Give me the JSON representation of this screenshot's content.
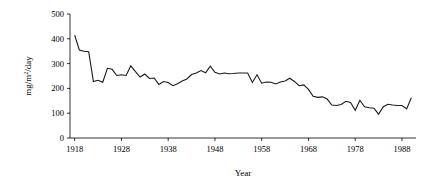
{
  "chart_data": {
    "type": "line",
    "title": "",
    "subtitle": "",
    "xlabel": "Year",
    "ylabel": "mg/m2/day",
    "ylabel_parts": {
      "pre": "mg/m",
      "sup": "2",
      "post": "/day"
    },
    "xlim": [
      1917,
      1991
    ],
    "ylim": [
      0,
      500
    ],
    "ytick_values": [
      0,
      100,
      200,
      300,
      400,
      500
    ],
    "ytick_labels": [
      "0",
      "100",
      "200",
      "300",
      "400",
      "500"
    ],
    "xtick_values": [
      1918,
      1928,
      1938,
      1948,
      1958,
      1968,
      1978,
      1988
    ],
    "xtick_labels": [
      "1918",
      "1928",
      "1938",
      "1948",
      "1958",
      "1968",
      "1978",
      "1988"
    ],
    "grid": false,
    "legend": null,
    "series": [
      {
        "name": "sedimentation rate",
        "color": "#1a1a1a",
        "x": [
          1918,
          1919,
          1920,
          1921,
          1922,
          1923,
          1924,
          1925,
          1926,
          1927,
          1928,
          1929,
          1930,
          1931,
          1932,
          1933,
          1934,
          1935,
          1936,
          1937,
          1938,
          1939,
          1940,
          1941,
          1942,
          1943,
          1944,
          1945,
          1946,
          1947,
          1948,
          1949,
          1950,
          1951,
          1952,
          1953,
          1954,
          1955,
          1956,
          1957,
          1958,
          1959,
          1960,
          1961,
          1962,
          1963,
          1964,
          1965,
          1966,
          1967,
          1968,
          1969,
          1970,
          1971,
          1972,
          1973,
          1974,
          1975,
          1976,
          1977,
          1978,
          1979,
          1980,
          1981,
          1982,
          1983,
          1984,
          1985,
          1986,
          1987,
          1988,
          1989,
          1990
        ],
        "y": [
          415,
          355,
          350,
          348,
          228,
          233,
          225,
          281,
          277,
          252,
          255,
          252,
          291,
          268,
          246,
          258,
          240,
          242,
          216,
          228,
          224,
          211,
          219,
          230,
          238,
          256,
          262,
          272,
          263,
          290,
          265,
          258,
          262,
          259,
          260,
          262,
          262,
          262,
          224,
          255,
          221,
          226,
          225,
          218,
          226,
          230,
          241,
          228,
          211,
          214,
          196,
          168,
          164,
          166,
          157,
          133,
          131,
          135,
          148,
          143,
          112,
          152,
          126,
          122,
          120,
          96,
          126,
          136,
          133,
          131,
          131,
          117,
          162
        ]
      }
    ]
  },
  "axes": {
    "y_axis_name": "y-axis",
    "x_axis_name": "x-axis"
  }
}
